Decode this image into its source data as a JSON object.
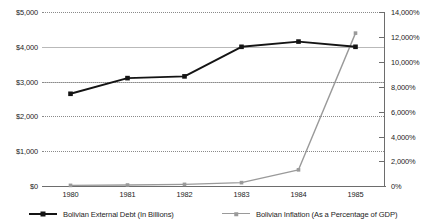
{
  "chart_data": {
    "type": "line",
    "title": "",
    "subtitle": "",
    "xlabel": "",
    "ylabel": "",
    "grid": true,
    "legend_position": "bottom",
    "x": [
      "1980",
      "1981",
      "1982",
      "1983",
      "1984",
      "1985"
    ],
    "categories": [
      "1980",
      "1981",
      "1982",
      "1983",
      "1984",
      "1985"
    ],
    "axes": {
      "left": {
        "label": "Bolivian External Debt (In Billions)",
        "min": 0,
        "max": 5000,
        "step": 1000,
        "ticks": [
          "$0",
          "$1,000",
          "$2,000",
          "$3,000",
          "$4,000",
          "$5,000"
        ],
        "tick_values": [
          0,
          1000,
          2000,
          3000,
          4000,
          5000
        ]
      },
      "right": {
        "label": "Bolivian Inflation (As a Percentage of GDP)",
        "min": 0,
        "max": 14000,
        "step": 2000,
        "ticks": [
          "0%",
          "2,000%",
          "4,000%",
          "6,000%",
          "8,000%",
          "10,000%",
          "12,000%",
          "14,000%"
        ],
        "tick_values": [
          0,
          2000,
          4000,
          6000,
          8000,
          10000,
          12000,
          14000
        ]
      }
    },
    "series": [
      {
        "name": "Bolivian External Debt (In Billions)",
        "axis": "left",
        "color": "#141414",
        "marker": "square",
        "values": [
          2650,
          3100,
          3150,
          4000,
          4150,
          4000
        ]
      },
      {
        "name": "Bolivian Inflation (As a Percentage of GDP)",
        "axis": "right",
        "color": "#9a9a9a",
        "marker": "square",
        "values": [
          50,
          80,
          130,
          270,
          1300,
          12300
        ]
      }
    ]
  },
  "legend": {
    "items": [
      {
        "label": "Bolivian External Debt (In Billions)",
        "color": "#141414"
      },
      {
        "label": "Bolivian Inflation (As a Percentage of GDP)",
        "color": "#9a9a9a"
      }
    ]
  }
}
